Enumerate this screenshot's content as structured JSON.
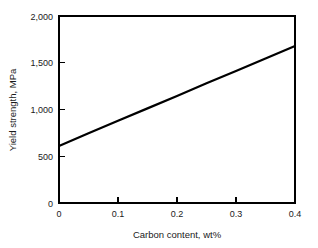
{
  "chart_data": {
    "type": "line",
    "title": "",
    "subtitle": "",
    "xlabel": "Carbon content, wt%",
    "ylabel": "Yield strength, MPa",
    "xlim": [
      0,
      0.4
    ],
    "ylim": [
      0,
      2000
    ],
    "grid": false,
    "legend": false,
    "legend_position": "none",
    "x_ticks": [
      0,
      0.1,
      0.2,
      0.3,
      0.4
    ],
    "x_tick_labels": [
      "0",
      "0.1",
      "0.2",
      "0.3",
      "0.4"
    ],
    "y_ticks": [
      0,
      500,
      1000,
      1500,
      2000
    ],
    "y_tick_labels": [
      "0",
      "500",
      "1,000",
      "1,500",
      "2,000"
    ],
    "series": [
      {
        "name": "Yield strength vs carbon content",
        "color": "#000000",
        "x": [
          0.0,
          0.05,
          0.1,
          0.15,
          0.2,
          0.25,
          0.3,
          0.35,
          0.4
        ],
        "values": [
          610,
          745,
          880,
          1012,
          1145,
          1280,
          1412,
          1545,
          1680
        ]
      }
    ],
    "annotations": []
  },
  "axes": {
    "frame_color": "#000000",
    "tick_direction": "in"
  }
}
